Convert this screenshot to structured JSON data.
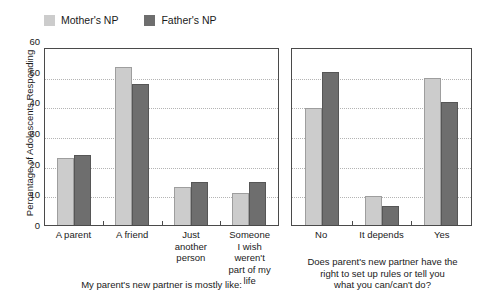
{
  "legend": {
    "entries": [
      {
        "label": "Mother's NP",
        "color": "#cccccc",
        "icon": "square-swatch-light"
      },
      {
        "label": "Father's NP",
        "color": "#6e6e6e",
        "icon": "square-swatch-dark"
      }
    ]
  },
  "axis": {
    "ylabel": "Percentage of Adolescents Responding",
    "yticks": [
      "0",
      "10",
      "20",
      "30",
      "40",
      "50",
      "60"
    ]
  },
  "captions": {
    "left": "My parent's new partner is mostly like:",
    "right_line1": "Does parent's new partner have the",
    "right_line2": "right to set up rules or tell you",
    "right_line3": "what you can/can't do?"
  },
  "left_categories": [
    {
      "line1": "A parent",
      "line2": "",
      "line3": ""
    },
    {
      "line1": "A friend",
      "line2": "",
      "line3": ""
    },
    {
      "line1": "Just",
      "line2": "another",
      "line3": "person"
    },
    {
      "line1": "Someone",
      "line2": "I wish weren't",
      "line3": "part of my life"
    }
  ],
  "right_categories": [
    {
      "line1": "No",
      "line2": "",
      "line3": ""
    },
    {
      "line1": "It depends",
      "line2": "",
      "line3": ""
    },
    {
      "line1": "Yes",
      "line2": "",
      "line3": ""
    }
  ],
  "chart_data": [
    {
      "type": "bar",
      "title": "",
      "xlabel": "My parent's new partner is mostly like:",
      "ylabel": "Percentage of Adolescents Responding",
      "ylim": [
        0,
        60
      ],
      "yticks": [
        0,
        10,
        20,
        30,
        40,
        50,
        60
      ],
      "grid": true,
      "legend_position": "top-left",
      "categories": [
        "A parent",
        "A friend",
        "Just another person",
        "Someone I wish weren't part of my life"
      ],
      "series": [
        {
          "name": "Mother's NP",
          "color": "#cccccc",
          "values": [
            23,
            54,
            13,
            11
          ]
        },
        {
          "name": "Father's NP",
          "color": "#6e6e6e",
          "values": [
            24,
            48,
            14.5,
            14.5
          ]
        }
      ]
    },
    {
      "type": "bar",
      "title": "",
      "xlabel": "Does parent's new partner have the right to set up rules or tell you what you can/can't do?",
      "ylabel": "Percentage of Adolescents Responding",
      "ylim": [
        0,
        60
      ],
      "yticks": [
        0,
        10,
        20,
        30,
        40,
        50,
        60
      ],
      "grid": true,
      "legend_position": "top-left",
      "categories": [
        "No",
        "It depends",
        "Yes"
      ],
      "series": [
        {
          "name": "Mother's NP",
          "color": "#cccccc",
          "values": [
            40,
            10,
            50
          ]
        },
        {
          "name": "Father's NP",
          "color": "#6e6e6e",
          "values": [
            52,
            6.5,
            42
          ]
        }
      ]
    }
  ]
}
